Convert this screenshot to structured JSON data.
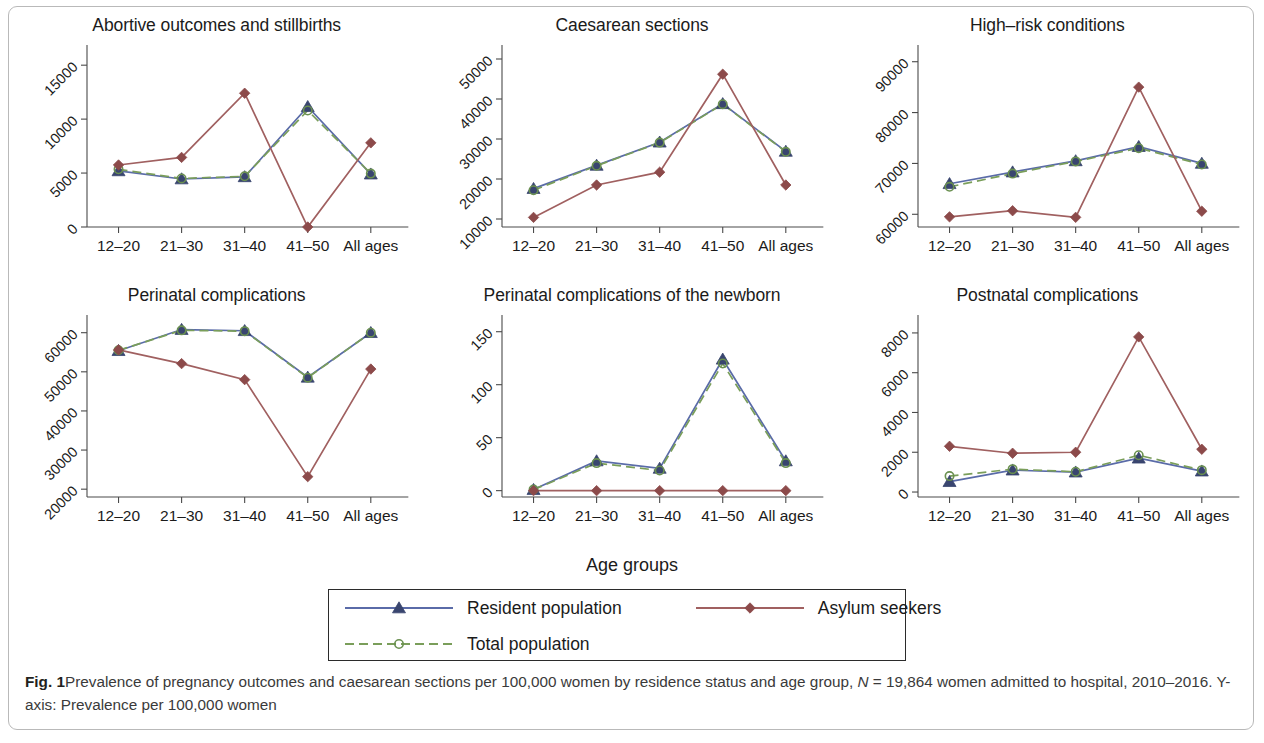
{
  "figure": {
    "label": "Fig. 1",
    "caption_part1": "Prevalence of pregnancy outcomes and caesarean sections per 100,000 women by residence status and age group, ",
    "caption_italic": "N",
    "caption_part2": " = 19,864 women admitted to hospital, 2010–2016. Y-axis: Prevalence per 100,000 women",
    "x_axis_title": "Age groups"
  },
  "legend": {
    "items": [
      {
        "name": "resident",
        "label": "Resident population",
        "color": "#5a6ba8",
        "marker_color": "#39456f",
        "marker": "triangle",
        "dash": "solid"
      },
      {
        "name": "asylum",
        "label": "Asylum seekers",
        "color": "#a06060",
        "marker_color": "#8c4a4a",
        "marker": "diamond",
        "dash": "solid"
      },
      {
        "name": "total",
        "label": "Total population",
        "color": "#7a9e5a",
        "marker_color": "#6a9050",
        "marker": "circle",
        "dash": "dashed"
      }
    ]
  },
  "chart_data": [
    {
      "id": "abortive",
      "type": "line",
      "title": "Abortive outcomes and stillbirths",
      "xlabel": "Age groups",
      "ylabel": "Prevalence per 100,000 women",
      "categories": [
        "12–20",
        "21–30",
        "31–40",
        "41–50",
        "All ages"
      ],
      "yticks": [
        0,
        5000,
        10000,
        15000
      ],
      "ylim": [
        0,
        16500
      ],
      "grid": false,
      "series": [
        {
          "name": "Resident population",
          "values": [
            5200,
            4450,
            4650,
            11150,
            4900
          ]
        },
        {
          "name": "Asylum seekers",
          "values": [
            5750,
            6450,
            12400,
            0,
            7800
          ]
        },
        {
          "name": "Total population",
          "values": [
            5350,
            4500,
            4700,
            10800,
            4950
          ]
        }
      ]
    },
    {
      "id": "caesarean",
      "type": "line",
      "title": "Caesarean sections",
      "xlabel": "Age groups",
      "ylabel": "Prevalence per 100,000 women",
      "categories": [
        "12–20",
        "21–30",
        "31–40",
        "41–50",
        "All ages"
      ],
      "yticks": [
        10000,
        20000,
        30000,
        40000,
        50000
      ],
      "ylim": [
        8000,
        52500
      ],
      "grid": false,
      "series": [
        {
          "name": "Resident population",
          "values": [
            17600,
            23400,
            29200,
            38800,
            26900
          ]
        },
        {
          "name": "Asylum seekers",
          "values": [
            10400,
            18500,
            21700,
            46200,
            18500
          ]
        },
        {
          "name": "Total population",
          "values": [
            17200,
            23300,
            29100,
            38700,
            26800
          ]
        }
      ]
    },
    {
      "id": "highrisk",
      "type": "line",
      "title": "High–risk conditions",
      "xlabel": "Age groups",
      "ylabel": "Prevalence per 100,000 women",
      "categories": [
        "12–20",
        "21–30",
        "31–40",
        "41–50",
        "All ages"
      ],
      "yticks": [
        60000,
        70000,
        80000,
        90000
      ],
      "ylim": [
        57500,
        92500
      ],
      "grid": false,
      "series": [
        {
          "name": "Resident population",
          "values": [
            66000,
            68300,
            70500,
            73300,
            70000
          ]
        },
        {
          "name": "Asylum seekers",
          "values": [
            59500,
            60700,
            59400,
            85000,
            60600
          ]
        },
        {
          "name": "Total population",
          "values": [
            65400,
            68000,
            70400,
            73000,
            69800
          ]
        }
      ]
    },
    {
      "id": "perinatal",
      "type": "line",
      "title": "Perinatal complications",
      "xlabel": "Age groups",
      "ylabel": "Prevalence per 100,000 women",
      "categories": [
        "12–20",
        "21–30",
        "31–40",
        "41–50",
        "All ages"
      ],
      "yticks": [
        20000,
        30000,
        40000,
        50000,
        60000
      ],
      "ylim": [
        18000,
        63500
      ],
      "grid": false,
      "series": [
        {
          "name": "Resident population",
          "values": [
            55400,
            60800,
            60500,
            48600,
            60000
          ]
        },
        {
          "name": "Asylum seekers",
          "values": [
            55600,
            52100,
            48000,
            23200,
            50700
          ]
        },
        {
          "name": "Total population",
          "values": [
            55500,
            60600,
            60400,
            48500,
            60000
          ]
        }
      ]
    },
    {
      "id": "perinatal-newborn",
      "type": "line",
      "title": "Perinatal complications of the newborn",
      "xlabel": "Age groups",
      "ylabel": "Prevalence per 100,000 women",
      "categories": [
        "12–20",
        "21–30",
        "31–40",
        "41–50",
        "All ages"
      ],
      "yticks": [
        0,
        50,
        100,
        150
      ],
      "ylim": [
        -6,
        162
      ],
      "grid": false,
      "series": [
        {
          "name": "Resident population",
          "values": [
            1,
            28,
            21,
            124,
            28
          ]
        },
        {
          "name": "Asylum seekers",
          "values": [
            0,
            0,
            0,
            0,
            0
          ]
        },
        {
          "name": "Total population",
          "values": [
            1,
            26,
            19,
            120,
            26
          ]
        }
      ]
    },
    {
      "id": "postnatal",
      "type": "line",
      "title": "Postnatal complications",
      "xlabel": "Age groups",
      "ylabel": "Prevalence per 100,000 women",
      "categories": [
        "12–20",
        "21–30",
        "31–40",
        "41–50",
        "All ages"
      ],
      "yticks": [
        0,
        2000,
        4000,
        6000,
        8000
      ],
      "ylim": [
        -250,
        8700
      ],
      "grid": false,
      "series": [
        {
          "name": "Resident population",
          "values": [
            520,
            1100,
            1000,
            1700,
            1050
          ]
        },
        {
          "name": "Asylum seekers",
          "values": [
            2300,
            1950,
            2000,
            7800,
            2150
          ]
        },
        {
          "name": "Total population",
          "values": [
            800,
            1150,
            1020,
            1850,
            1100
          ]
        }
      ]
    }
  ]
}
